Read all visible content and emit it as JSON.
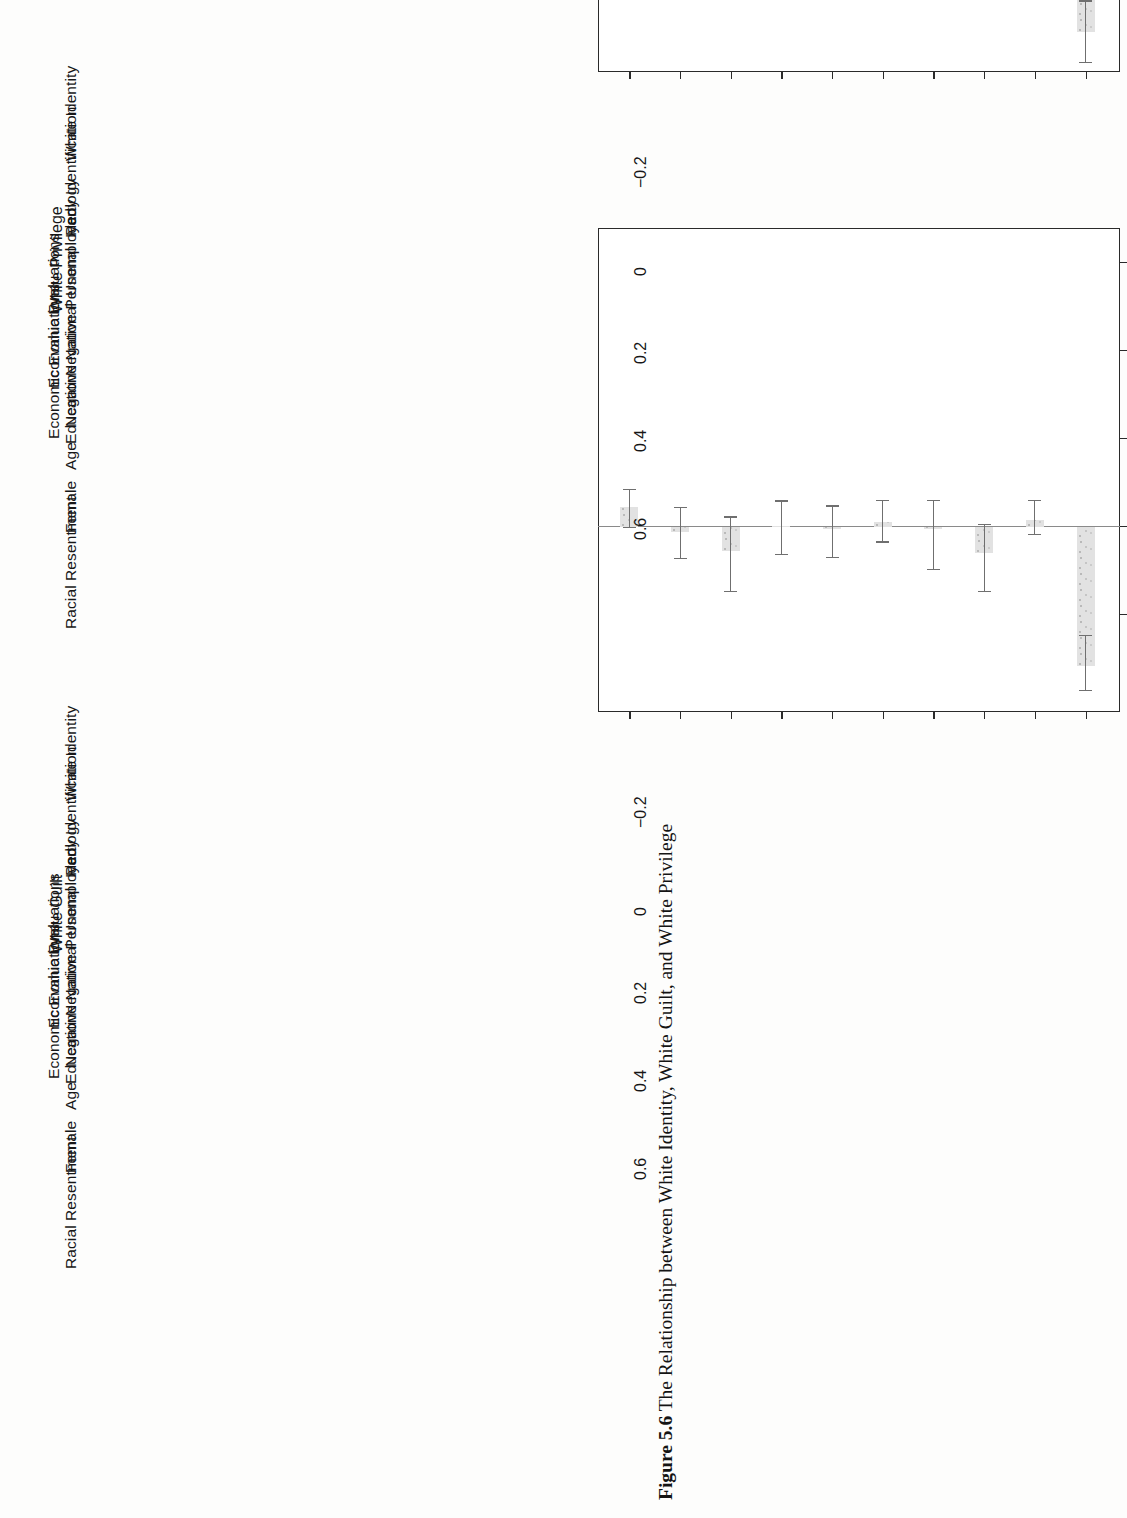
{
  "figure": {
    "caption_label": "Figure 5.6",
    "caption_text": "The Relationship between White Identity, White Guilt, and White Privilege",
    "orientation": "rotated-90-ccw",
    "page_background": "#fdfdfc"
  },
  "chart_data": {
    "type": "bar",
    "title": "The Relationship between White Identity, White Guilt, and White Privilege",
    "orientation": "horizontal-bars-rotated",
    "xlabel": "",
    "ylabel": "",
    "ylim": [
      -0.42,
      0.68
    ],
    "ticks": [
      "-0.2",
      "0",
      "0.2",
      "0.4",
      "0.6"
    ],
    "tick_values": [
      -0.2,
      0,
      0.2,
      0.4,
      0.6
    ],
    "grid": false,
    "legend": "none",
    "zero_reference_line": true,
    "error_bars": "95% confidence intervals",
    "bar_fill_color": "#e2e2e2",
    "bar_edge_color": "#9a9a9a",
    "error_bar_color": "#6f6f6f",
    "axis_color": "#2a2a2a",
    "categories": [
      "White Identity",
      "Party Identification",
      "Ideology",
      "Unemployed",
      "Negative Personal\nEconomic Evaluations",
      "Negative National\nEconomic Evaluations",
      "Education",
      "Age",
      "Female",
      "Racial Resentment"
    ],
    "category_lines": [
      [
        "White Identity"
      ],
      [
        "Party Identification"
      ],
      [
        "Ideology"
      ],
      [
        "Unemployed"
      ],
      [
        "Negative Personal",
        "Economic Evaluations"
      ],
      [
        "Negative National",
        "Economic Evaluations"
      ],
      [
        "Education"
      ],
      [
        "Age"
      ],
      [
        "Female"
      ],
      [
        "Racial Resentment"
      ]
    ],
    "panels": [
      {
        "name": "White Guilt",
        "title": "White Guilt",
        "position": "left",
        "values": [
          0.045,
          -0.012,
          -0.055,
          0.0,
          -0.004,
          0.012,
          -0.003,
          -0.058,
          0.016,
          -0.315
        ],
        "ci_low": [
          -0.002,
          -0.072,
          -0.148,
          -0.064,
          -0.07,
          -0.035,
          -0.098,
          -0.148,
          -0.018,
          -0.372
        ],
        "ci_high": [
          0.085,
          0.043,
          0.022,
          0.058,
          0.047,
          0.06,
          0.06,
          0.005,
          0.06,
          -0.248
        ]
      },
      {
        "name": "White Privilege",
        "title": "White Privilege",
        "position": "right",
        "values": [
          0.195,
          0.003,
          -0.075,
          0.006,
          -0.048,
          0.0,
          0.205,
          -0.02,
          -0.002,
          -0.33
        ],
        "ci_low": [
          0.152,
          -0.057,
          -0.16,
          -0.043,
          -0.092,
          -0.052,
          0.112,
          -0.072,
          -0.045,
          -0.4
        ],
        "ci_high": [
          0.243,
          0.058,
          0.002,
          0.057,
          -0.006,
          0.051,
          0.262,
          0.03,
          0.04,
          -0.26
        ]
      }
    ]
  }
}
